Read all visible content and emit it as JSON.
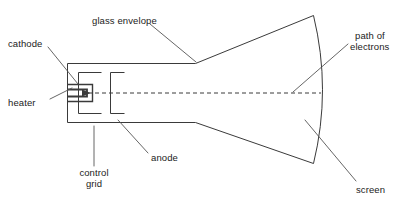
{
  "diagram": {
    "type": "labelled-cross-section-diagram",
    "background_color": "#ffffff",
    "line_color": "#3a3a3a",
    "text_color": "#222222",
    "beam_line_style": "dashed"
  },
  "labels": {
    "glass_envelope": "glass envelope",
    "cathode": "cathode",
    "heater": "heater",
    "control_grid_line1": "control",
    "control_grid_line2": "grid",
    "anode": "anode",
    "path_of_electrons_line1": "path of",
    "path_of_electrons_line2": "electrons",
    "screen": "screen"
  },
  "parts": [
    {
      "key": "glass_envelope",
      "name": "glass envelope",
      "description": "Outer evacuated glass body: narrow neck at left flaring into a cone toward the screen at right"
    },
    {
      "key": "cathode",
      "name": "cathode",
      "description": "Electron-emitting element at the left end inside the neck"
    },
    {
      "key": "heater",
      "name": "heater",
      "description": "Filament that heats the cathode, drawn as a hairpin inside the cathode"
    },
    {
      "key": "control_grid",
      "name": "control grid",
      "description": "Bracket-shaped electrode surrounding the cathode, controls beam intensity"
    },
    {
      "key": "anode",
      "name": "anode",
      "description": "Second bracket-shaped electrode downstream of the grid, accelerates electrons"
    },
    {
      "key": "path_of_electrons",
      "name": "path of electrons",
      "description": "Horizontal dashed centre line running from the cathode to the screen"
    },
    {
      "key": "screen",
      "name": "screen",
      "description": "Curved fluorescent face at the wide right end of the tube"
    }
  ]
}
